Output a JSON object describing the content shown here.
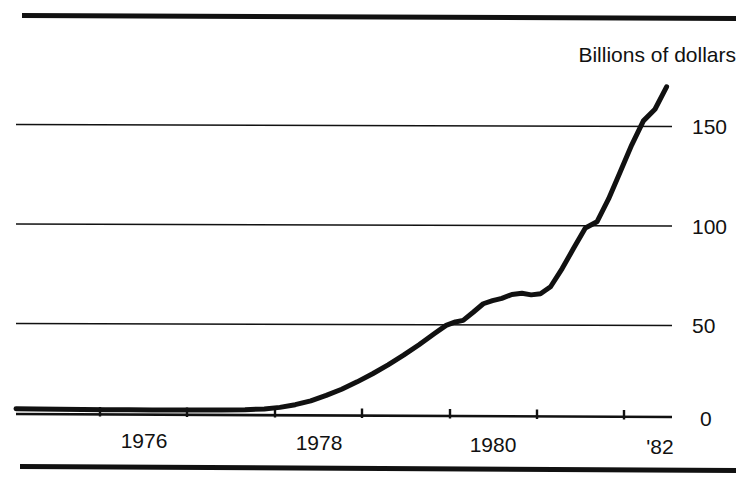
{
  "chart_data": {
    "type": "line",
    "title": "",
    "subtitle": "",
    "unit_label": "Billions of dollars",
    "xlabel": "",
    "ylabel": "",
    "xlim": [
      1974.04,
      1982.52
    ],
    "ylim": [
      0,
      182
    ],
    "grid": true,
    "grid_axis": "y",
    "legend": false,
    "legend_position": "none",
    "x_tick_values": [
      1975,
      1976,
      1977,
      1978,
      1979,
      1980,
      1981,
      1982
    ],
    "x_tick_labels": [
      "",
      "1976",
      "",
      "1978",
      "",
      "1980",
      "",
      "'82"
    ],
    "x_label_positions": [
      1976,
      1978,
      1980,
      1982
    ],
    "x_labels_shown": [
      "1976",
      "1978",
      "1980",
      "'82"
    ],
    "y_tick_values": [
      0,
      50,
      100,
      150
    ],
    "y_tick_labels": [
      "0",
      "50",
      "100",
      "150"
    ],
    "series": [
      {
        "name": "Assets",
        "x": [
          1974.04,
          1974.3,
          1974.6,
          1974.9,
          1975.2,
          1975.5,
          1975.8,
          1976.1,
          1976.4,
          1976.7,
          1977.0,
          1977.25,
          1977.45,
          1977.65,
          1977.85,
          1978.05,
          1978.25,
          1978.45,
          1978.65,
          1978.85,
          1979.05,
          1979.25,
          1979.45,
          1979.6,
          1979.72,
          1979.82,
          1979.95,
          1980.08,
          1980.2,
          1980.32,
          1980.45,
          1980.58,
          1980.7,
          1980.82,
          1980.95,
          1981.1,
          1981.25,
          1981.4,
          1981.55,
          1981.7,
          1981.85,
          1982.0,
          1982.15,
          1982.3,
          1982.45
        ],
        "y": [
          3.5,
          3.4,
          3.2,
          3.1,
          3.0,
          3.0,
          2.9,
          2.9,
          2.9,
          2.9,
          3.0,
          3.4,
          4.2,
          5.6,
          7.6,
          10.4,
          13.6,
          17.4,
          21.6,
          26.2,
          31.2,
          36.6,
          42.4,
          46.6,
          48.4,
          49.2,
          53.4,
          57.8,
          59.4,
          60.6,
          62.6,
          63.2,
          62.4,
          63.0,
          66.6,
          76.0,
          86.6,
          97.0,
          100.2,
          112.0,
          126.0,
          140.0,
          152.4,
          158.4,
          170.0
        ]
      }
    ],
    "annotations": []
  },
  "figure": {
    "top_rule": "horizontal-rule",
    "bottom_rule": "horizontal-rule"
  }
}
